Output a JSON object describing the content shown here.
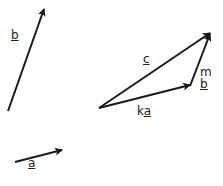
{
  "vectors": {
    "b": {
      "label": "b"
    },
    "a": {
      "label": "a"
    },
    "c": {
      "label": "c"
    },
    "ka": {
      "coef": "k",
      "label": "a"
    },
    "mb": {
      "coef": "m",
      "label": "b"
    }
  },
  "colors": {
    "stroke": "#1a1a1a",
    "background": "#ffffff"
  }
}
